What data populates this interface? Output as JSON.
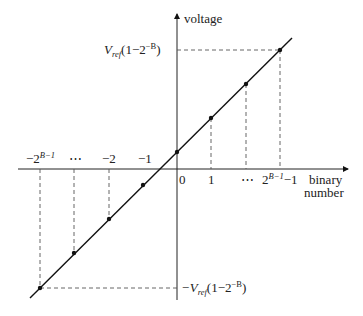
{
  "diagram": {
    "type": "transfer-characteristic",
    "y_axis_label": "voltage",
    "x_axis_label_line1": "binary",
    "x_axis_label_line2": "number",
    "x_ticks_positive": [
      "0",
      "1",
      "⋯",
      "2^{B-1}-1"
    ],
    "x_ticks_negative": [
      "-2^{B-1}",
      "⋯",
      "-2",
      "-1"
    ],
    "top_level_label": {
      "prefix": "V",
      "sub": "ref",
      "body": "(1−2",
      "sup": "−B",
      "close": ")"
    },
    "bottom_level_label": {
      "prefix": "−V",
      "sub": "ref",
      "body": "(1−2",
      "sup": "−B",
      "close": ")"
    },
    "labels": {
      "tick_0": "0",
      "tick_1": "1",
      "tick_dots_pos": "⋯",
      "tick_max_base": "2",
      "tick_max_sup": "B−1",
      "tick_max_tail": "−1",
      "tick_m1": "−1",
      "tick_m2": "−2",
      "tick_dots_neg": "⋯",
      "tick_min_base": "−2",
      "tick_min_sup": "B−1"
    },
    "points": [
      {
        "x": 40,
        "y": 288
      },
      {
        "x": 74,
        "y": 253
      },
      {
        "x": 109,
        "y": 219
      },
      {
        "x": 143,
        "y": 185
      },
      {
        "x": 177,
        "y": 152
      },
      {
        "x": 211,
        "y": 118
      },
      {
        "x": 246,
        "y": 84
      },
      {
        "x": 280,
        "y": 50
      }
    ],
    "colors": {
      "line": "#111111",
      "dash": "#555555"
    }
  }
}
